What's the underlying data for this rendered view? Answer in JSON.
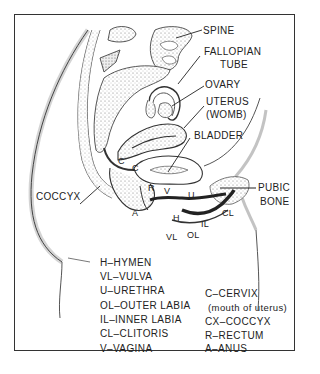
{
  "figure": {
    "callouts": {
      "spine": "SPINE",
      "fallopian_1": "FALLOPIAN",
      "fallopian_2": "TUBE",
      "ovary": "OVARY",
      "uterus_1": "UTERUS",
      "uterus_2": "(WOMB)",
      "bladder": "BLADDER",
      "coccyx": "COCCYX",
      "pubic_1": "PUBIC",
      "pubic_2": "BONE"
    },
    "short_labels": {
      "c1": "C",
      "c2": "C",
      "r": "R",
      "v": "V",
      "u": "U",
      "a": "A",
      "h": "H",
      "cl": "CL",
      "il": "IL",
      "ol": "OL",
      "vl": "VL"
    }
  },
  "legend": {
    "left": [
      "H–HYMEN",
      "VL–VULVA",
      "U–URETHRA",
      "OL–OUTER LABIA",
      "IL–INNER LABIA",
      "CL–CLITORIS",
      "V–VAGINA"
    ],
    "right": [
      "C–CERVIX",
      "(mouth of uterus)",
      "CX–COCCYX",
      "R–RECTUM",
      "A–ANUS"
    ]
  }
}
